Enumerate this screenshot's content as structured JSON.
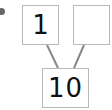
{
  "diagram": {
    "type": "number-bond",
    "parts": [
      {
        "id": "part-left",
        "value": "1"
      },
      {
        "id": "part-right",
        "value": ""
      }
    ],
    "whole": {
      "id": "whole",
      "value": "10"
    }
  }
}
